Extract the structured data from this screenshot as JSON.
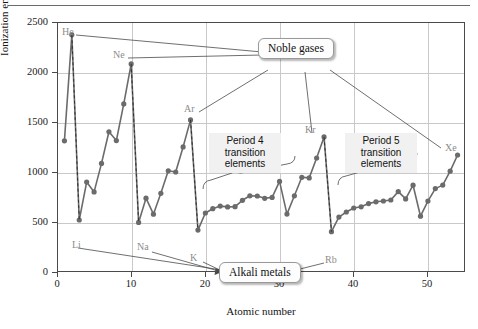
{
  "chart_data": {
    "type": "line",
    "title": "",
    "xlabel": "Atomic number",
    "ylabel": "Ionization energy (kJ/mol)",
    "xlim": [
      0,
      55
    ],
    "ylim": [
      0,
      2500
    ],
    "xticks": [
      0,
      10,
      20,
      30,
      40,
      50
    ],
    "yticks": [
      0,
      500,
      1000,
      1500,
      2000,
      2500
    ],
    "grid": true,
    "legend": "none",
    "series": [
      {
        "name": "First ionization energy",
        "color": "#6b6b6b",
        "x": [
          1,
          2,
          3,
          4,
          5,
          6,
          7,
          8,
          9,
          10,
          11,
          12,
          13,
          14,
          15,
          16,
          17,
          18,
          19,
          20,
          21,
          22,
          23,
          24,
          25,
          26,
          27,
          28,
          29,
          30,
          31,
          32,
          33,
          34,
          35,
          36,
          37,
          38,
          39,
          40,
          41,
          42,
          43,
          44,
          45,
          46,
          47,
          48,
          49,
          50,
          51,
          52,
          53,
          54
        ],
        "values": [
          1312,
          2372,
          520,
          899,
          801,
          1086,
          1402,
          1314,
          1681,
          2081,
          496,
          738,
          578,
          787,
          1012,
          1000,
          1251,
          1521,
          419,
          590,
          633,
          659,
          651,
          653,
          717,
          762,
          760,
          737,
          746,
          906,
          579,
          762,
          947,
          941,
          1140,
          1351,
          403,
          549,
          600,
          640,
          652,
          684,
          702,
          710,
          720,
          804,
          731,
          868,
          558,
          709,
          834,
          869,
          1008,
          1170
        ]
      }
    ],
    "dropline_elements": [
      {
        "label": "He",
        "z": 2,
        "from": 2372,
        "to": 520
      },
      {
        "label": "Ne",
        "z": 10,
        "from": 2081,
        "to": 496
      },
      {
        "label": "Ar",
        "z": 18,
        "from": 1521,
        "to": 419
      },
      {
        "label": "Kr",
        "z": 36,
        "from": 1351,
        "to": 403
      }
    ],
    "point_labels": [
      {
        "text": "He",
        "z": 2,
        "value": 2372
      },
      {
        "text": "Ne",
        "z": 10,
        "value": 2081
      },
      {
        "text": "Ar",
        "z": 18,
        "value": 1521
      },
      {
        "text": "Kr",
        "z": 36,
        "value": 1351
      },
      {
        "text": "Xe",
        "z": 54,
        "value": 1170
      },
      {
        "text": "Li",
        "z": 3,
        "value": 520
      },
      {
        "text": "Na",
        "z": 11,
        "value": 496
      },
      {
        "text": "K",
        "z": 19,
        "value": 419
      },
      {
        "text": "Rb",
        "z": 37,
        "value": 403
      }
    ],
    "annotations": [
      {
        "name": "noble-gases",
        "text": "Noble gases"
      },
      {
        "name": "alkali-metals",
        "text": "Alkali metals"
      },
      {
        "name": "period-4",
        "text": "Period 4\ntransition\nelements"
      },
      {
        "name": "period-5",
        "text": "Period 5\ntransition\nelements"
      }
    ],
    "colors": {
      "series": "#6b6b6b",
      "grid": "#c9c9c9",
      "frame": "#4a4a4a",
      "label": "#8c8c8c",
      "text": "#111111"
    }
  },
  "axes": {
    "y_title": "Ionization energy (kJ/mol)",
    "x_title": "Atomic number",
    "y_ticks": [
      "2500",
      "2000",
      "1500",
      "1000",
      "500",
      "0"
    ],
    "x_ticks": [
      "0",
      "10",
      "20",
      "30",
      "40",
      "50"
    ]
  },
  "labels": {
    "he": "He",
    "ne": "Ne",
    "ar": "Ar",
    "kr": "Kr",
    "xe": "Xe",
    "li": "Li",
    "na": "Na",
    "k": "K",
    "rb": "Rb"
  },
  "callouts": {
    "noble_gases": "Noble gases",
    "alkali_metals": "Alkali metals"
  },
  "notes": {
    "period4": "Period 4\ntransition\nelements",
    "period5": "Period 5\ntransition\nelements"
  }
}
